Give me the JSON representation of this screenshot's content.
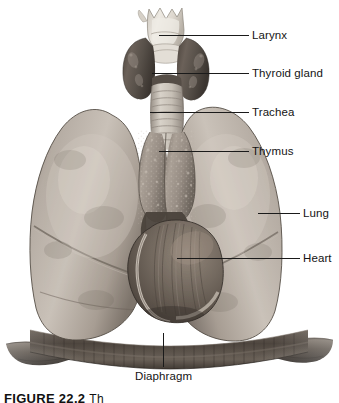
{
  "figure": {
    "kind": "anatomical-illustration",
    "background_color": "#ffffff",
    "label_color": "#141414",
    "leader_color": "#1a1a1a",
    "caption": {
      "number": "FIGURE 22.2",
      "text": "Th",
      "clipped": true
    }
  },
  "labels": [
    {
      "id": "larynx",
      "text": "Larynx",
      "text_x": 252,
      "text_y": 29,
      "leader": {
        "x1": 159,
        "y1": 35,
        "x2": 249,
        "y2": 35,
        "type": "horizontal"
      }
    },
    {
      "id": "thyroid-gland",
      "text": "Thyroid gland",
      "text_x": 252,
      "text_y": 67,
      "leader": {
        "x1": 152,
        "y1": 73,
        "x2": 249,
        "y2": 73,
        "type": "horizontal"
      }
    },
    {
      "id": "trachea",
      "text": "Trachea",
      "text_x": 252,
      "text_y": 106,
      "leader": {
        "x1": 150,
        "y1": 112,
        "x2": 249,
        "y2": 112,
        "type": "horizontal"
      }
    },
    {
      "id": "thymus",
      "text": "Thymus",
      "text_x": 252,
      "text_y": 145,
      "leader": {
        "x1": 159,
        "y1": 151,
        "x2": 249,
        "y2": 151,
        "type": "horizontal"
      }
    },
    {
      "id": "lung",
      "text": "Lung",
      "text_x": 303,
      "text_y": 207,
      "leader": {
        "x1": 258,
        "y1": 213,
        "x2": 300,
        "y2": 213,
        "type": "horizontal"
      }
    },
    {
      "id": "heart",
      "text": "Heart",
      "text_x": 303,
      "text_y": 252,
      "leader": {
        "x1": 177,
        "y1": 258,
        "x2": 300,
        "y2": 258,
        "type": "horizontal"
      }
    },
    {
      "id": "diaphragm",
      "text": "Diaphragm",
      "text_x": 135,
      "text_y": 370,
      "leader": {
        "x1": 163,
        "y1": 333,
        "x2": 163,
        "y2": 367,
        "type": "vertical"
      }
    }
  ],
  "structures": [
    {
      "id": "larynx",
      "name": "Larynx",
      "tone": "pale cartilage",
      "color": "#dedad4"
    },
    {
      "id": "thyroid-gland",
      "name": "Thyroid gland",
      "tone": "dark gland",
      "color": "#585049"
    },
    {
      "id": "trachea",
      "name": "Trachea",
      "tone": "ringed tube",
      "color": "#cfc8bf"
    },
    {
      "id": "thymus",
      "name": "Thymus",
      "tone": "mid gray lobes",
      "color": "#9d948a"
    },
    {
      "id": "lung-left",
      "name": "Lung",
      "tone": "light gray",
      "color": "#b3aaa1"
    },
    {
      "id": "lung-right",
      "name": "Lung",
      "tone": "light gray",
      "color": "#b3aaa1"
    },
    {
      "id": "heart",
      "name": "Heart",
      "tone": "dark gray",
      "color": "#6f665e"
    },
    {
      "id": "diaphragm",
      "name": "Diaphragm",
      "tone": "striated band",
      "color": "#5d554d"
    }
  ]
}
